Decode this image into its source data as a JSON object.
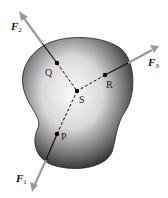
{
  "diagram": {
    "body_color_edge": "#2a2a2a",
    "body_color_center": "#f4f4f4",
    "arrow_color": "#9a9a9a",
    "points": {
      "P": {
        "label": "P",
        "x": 57,
        "y": 134
      },
      "Q": {
        "label": "Q",
        "x": 57,
        "y": 63
      },
      "R": {
        "label": "R",
        "x": 105,
        "y": 75
      },
      "S": {
        "label": "S",
        "x": 77,
        "y": 91
      }
    },
    "forces": [
      {
        "name": "F1",
        "label": "F",
        "subscript": "1",
        "through": "P"
      },
      {
        "name": "F2",
        "label": "F",
        "subscript": "2",
        "through": "Q"
      },
      {
        "name": "F3",
        "label": "F",
        "subscript": "3",
        "through": "R"
      }
    ]
  }
}
